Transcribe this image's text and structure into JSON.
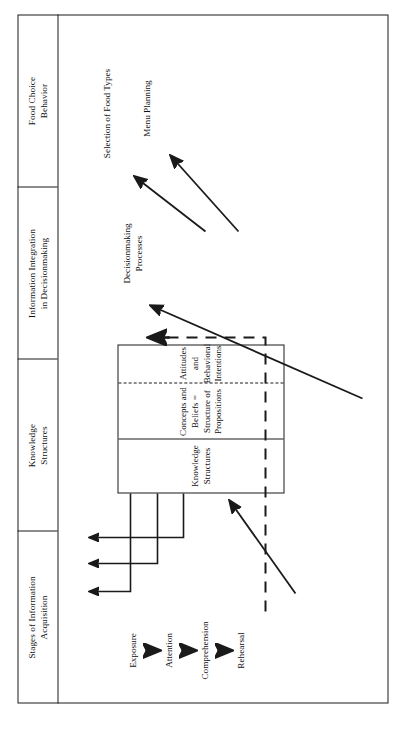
{
  "figure": {
    "orientation": "rotated-90-ccw",
    "type": "flow-diagram",
    "columns": [
      {
        "id": "stages",
        "label_line1": "Stages of Information",
        "label_line2": "Acquisition"
      },
      {
        "id": "knowledge",
        "label_line1": "Knowledge",
        "label_line2": "Structures"
      },
      {
        "id": "integration",
        "label_line1": "Information Integration",
        "label_line2": "in Decisionmaking"
      },
      {
        "id": "behavior",
        "label_line1": "Food Choice",
        "label_line2": "Behavior"
      }
    ],
    "stages": [
      {
        "id": "exposure",
        "label": "Exposure"
      },
      {
        "id": "attention",
        "label": "Attention"
      },
      {
        "id": "comprehension",
        "label": "Comprehension"
      },
      {
        "id": "rehearsal",
        "label": "Rehearsal"
      }
    ],
    "knowledge_box": {
      "cells": [
        {
          "id": "ks-title",
          "line1": "Knowledge",
          "line2": "Structures"
        },
        {
          "id": "ks-concepts",
          "line1": "Concepts and Beliefs =",
          "line2": "Structure of Propositions"
        },
        {
          "id": "ks-attitudes",
          "line1": "Attitudes and",
          "line2": "Behavioral Intentions"
        }
      ]
    },
    "integration": {
      "process": {
        "id": "decisionmaking",
        "line1": "Decisionmaking",
        "line2": "Processes"
      }
    },
    "outcomes": [
      {
        "id": "food-types",
        "label": "Selection of Food Types"
      },
      {
        "id": "menu-planning",
        "label": "Menu Planning"
      }
    ],
    "colors": {
      "ink": "#1a1a1a",
      "background": "#ffffff"
    }
  }
}
